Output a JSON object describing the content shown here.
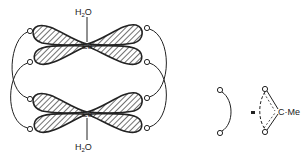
{
  "diagram": {
    "top_center": {
      "metal": "Cu",
      "ligand": "H₂O",
      "ligand_main": "H",
      "ligand_sub": "2",
      "ligand_tail": "O"
    },
    "bottom_center": {
      "metal": "Cu",
      "ligand": "H₂O",
      "ligand_main": "H",
      "ligand_sub": "2",
      "ligand_tail": "O"
    },
    "oxygen_label": "O",
    "legend": {
      "lhs_atoms": [
        "O",
        "O"
      ],
      "equals": "=",
      "rhs_atoms": [
        "O",
        "O"
      ],
      "group": "C·Me"
    },
    "colors": {
      "line": "#222222",
      "hatch": "#333333",
      "background": "#ffffff"
    }
  }
}
